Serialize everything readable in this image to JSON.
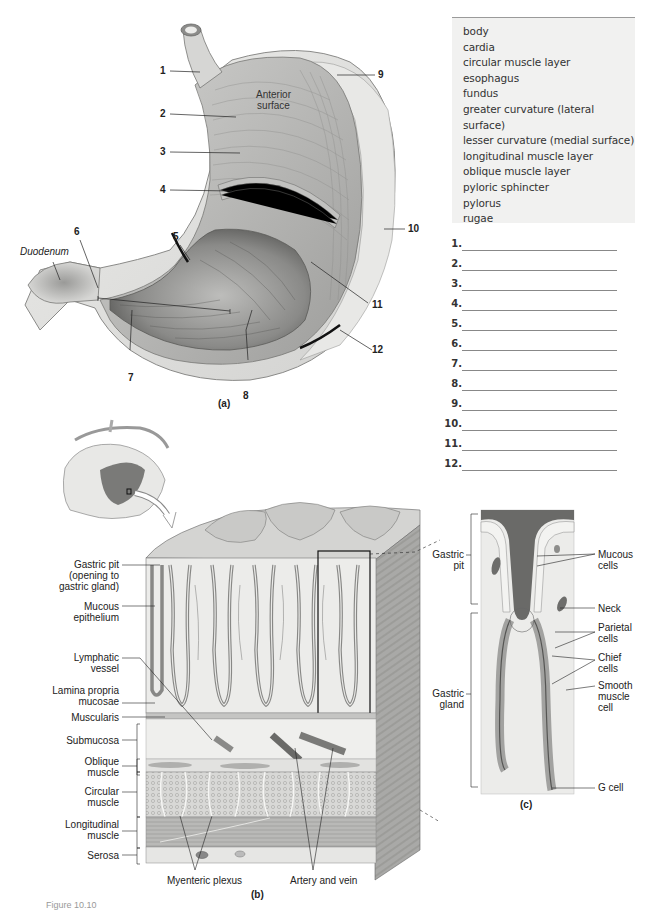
{
  "word_bank": {
    "terms": [
      "body",
      "cardia",
      "circular muscle layer",
      "esophagus",
      "fundus",
      "greater curvature (lateral surface)",
      "lesser curvature (medial surface)",
      "longitudinal muscle layer",
      "oblique muscle layer",
      "pyloric sphincter",
      "pylorus",
      "rugae"
    ]
  },
  "answer_blanks": {
    "numbers": [
      "1.",
      "2.",
      "3.",
      "4.",
      "5.",
      "6.",
      "7.",
      "8.",
      "9.",
      "10.",
      "11.",
      "12."
    ]
  },
  "figure_a": {
    "panel_label": "(a)",
    "callouts": [
      "1",
      "2",
      "3",
      "4",
      "5",
      "6",
      "7",
      "8",
      "9",
      "10",
      "11",
      "12"
    ],
    "text_labels": {
      "anterior_surface": "Anterior\nsurface",
      "anterior_line1": "Anterior",
      "anterior_line2": "surface",
      "duodenum": "Duodenum"
    }
  },
  "figure_b": {
    "panel_label": "(b)",
    "left_labels": {
      "gastric_pit": [
        "Gastric pit",
        "(opening to",
        "gastric gland)"
      ],
      "mucous_epithelium": [
        "Mucous",
        "epithelium"
      ],
      "lymphatic_vessel": [
        "Lymphatic",
        "vessel"
      ],
      "lamina_propria": [
        "Lamina propria",
        "mucosae"
      ],
      "muscularis": [
        "Muscularis"
      ],
      "submucosa": [
        "Submucosa"
      ],
      "oblique_muscle": [
        "Oblique",
        "muscle"
      ],
      "circular_muscle": [
        "Circular",
        "muscle"
      ],
      "longitudinal_muscle": [
        "Longitudinal",
        "muscle"
      ],
      "serosa": [
        "Serosa"
      ]
    },
    "bottom_labels": {
      "myenteric_plexus": "Myenteric plexus",
      "artery_and_vein": "Artery and vein"
    }
  },
  "figure_c": {
    "panel_label": "(c)",
    "left_labels": {
      "gastric_pit": [
        "Gastric",
        "pit"
      ],
      "gastric_gland": [
        "Gastric",
        "gland"
      ]
    },
    "right_labels": {
      "mucous_cells": [
        "Mucous",
        "cells"
      ],
      "neck": [
        "Neck"
      ],
      "parietal_cells": [
        "Parietal",
        "cells"
      ],
      "chief_cells": [
        "Chief",
        "cells"
      ],
      "smooth_muscle_cell": [
        "Smooth",
        "muscle",
        "cell"
      ],
      "g_cell": [
        "G cell"
      ]
    }
  },
  "caption": {
    "text": "Figure 10.10"
  },
  "colors": {
    "tissue_light": "#e4e4e2",
    "tissue_mid": "#b8b8b6",
    "tissue_dark": "#6d6d6b",
    "bank_bg": "#f1f1f0"
  }
}
